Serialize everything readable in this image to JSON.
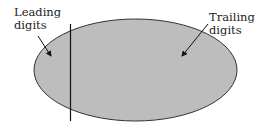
{
  "diagram": {
    "shape": "ellipse",
    "fill_color": "#bdbdbd",
    "stroke_color": "#333333",
    "divider_color": "#111111",
    "labels": {
      "leading": {
        "line1": "Leading",
        "line2": "digits"
      },
      "trailing": {
        "line1": "Trailing",
        "line2": "digits"
      }
    }
  }
}
